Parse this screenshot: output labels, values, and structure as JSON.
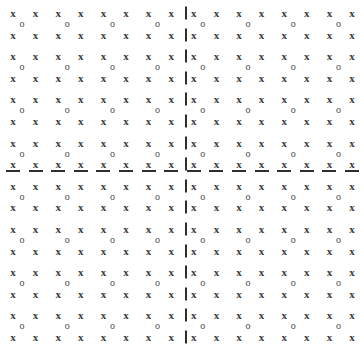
{
  "figure": {
    "title": "",
    "background_color": "#ffffff",
    "width": 364,
    "height": 349
  },
  "lattice": {
    "description": "Two-dimensional square lattice of x markers with o markers at the centres of each square cell, partitioned into four quadrants by dashed horizontal and vertical axis lines.",
    "site_symbol_a": "x",
    "site_symbol_b": "o",
    "site_a_color": "#3b3b3b",
    "site_b_color": "#4a4a4a",
    "site_a_count": 256,
    "site_b_count": 64,
    "columns_a": 16,
    "rows_a": 16,
    "columns_b": 8,
    "rows_b": 8,
    "unit_cells_x": 8,
    "unit_cells_y": 8,
    "origin_x": 13,
    "origin_y": 13,
    "spacing_x": 22.6,
    "spacing_y": 21.6,
    "cell_pitch_x": 45.2,
    "cell_pitch_y": 43.2,
    "b_offset_x": 9,
    "b_offset_y": 11
  },
  "axes": {
    "color": "#2e2e2e",
    "style": "dashed",
    "thickness": 2,
    "horizontal": {
      "label": "horizontal-axis",
      "y": 171,
      "dash_length": 14,
      "dash_gap": 9,
      "dash_pitch": 22.6,
      "dash_start_x": 13,
      "dash_count": 16
    },
    "vertical": {
      "label": "vertical-axis",
      "x": 186,
      "dash_length": 13,
      "dash_gap": 9,
      "dash_pitch": 21.6,
      "dash_start_y": 13,
      "dash_count": 16
    }
  },
  "quadrants": [
    {
      "name": "top-left"
    },
    {
      "name": "top-right"
    },
    {
      "name": "bottom-left"
    },
    {
      "name": "bottom-right"
    }
  ]
}
